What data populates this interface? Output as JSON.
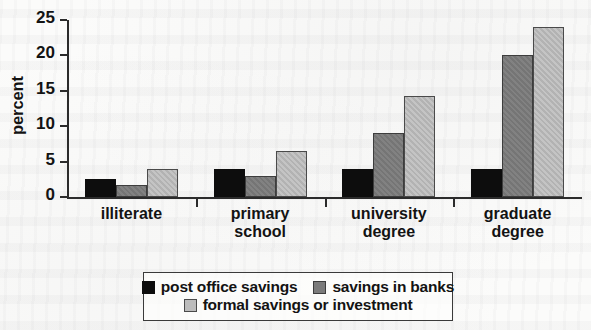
{
  "chart_data": {
    "type": "bar",
    "title": "",
    "xlabel": "",
    "ylabel": "percent",
    "ylim": [
      0,
      25
    ],
    "yticks": [
      0,
      5,
      10,
      15,
      20,
      25
    ],
    "grid": false,
    "legend_position": "bottom",
    "categories": [
      "illiterate",
      "primary school",
      "university degree",
      "graduate degree"
    ],
    "category_lines": [
      [
        "illiterate"
      ],
      [
        "primary",
        "school"
      ],
      [
        "university",
        "degree"
      ],
      [
        "graduate",
        "degree"
      ]
    ],
    "series": [
      {
        "name": "post office savings",
        "color": "#0d0d0d",
        "values": [
          2.5,
          4.0,
          4.0,
          4.0
        ]
      },
      {
        "name": "savings in banks",
        "color": "#7b7b7b",
        "values": [
          1.7,
          3.0,
          9.0,
          20.0
        ]
      },
      {
        "name": "formal savings or investment",
        "color": "#bcbcbc",
        "values": [
          4.0,
          6.5,
          14.2,
          24.0
        ]
      }
    ]
  },
  "axis": {
    "y_label": "percent",
    "y_tick_labels": [
      "25",
      "20",
      "15",
      "10",
      "5",
      "0"
    ]
  },
  "legend": {
    "entries": [
      {
        "label": "post office savings"
      },
      {
        "label": "savings in banks"
      },
      {
        "label": "formal savings or investment"
      }
    ]
  }
}
